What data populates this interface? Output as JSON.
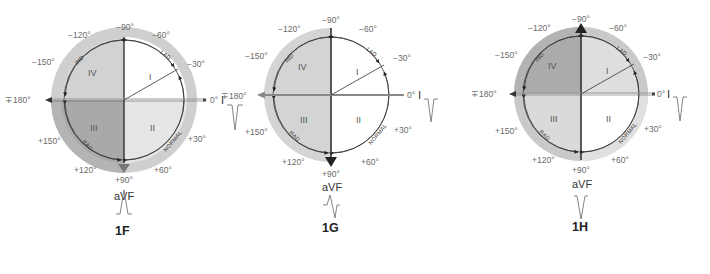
{
  "figures": [
    {
      "id": "1F",
      "label": "1F",
      "center": [
        124,
        100
      ],
      "quadrant_fill": {
        "I": "#ffffff",
        "II": "#e6e6e6",
        "III": "#a9a9a9",
        "IV": "#d2d2d2"
      },
      "outer_ring_fill": "#cfcfcf",
      "outer_ring_extent": "full",
      "axis_arrow": "+90",
      "lead_I_waveform": "negative",
      "aVF_waveform": "positive"
    },
    {
      "id": "1G",
      "label": "1G",
      "center": [
        331,
        95
      ],
      "quadrant_fill": {
        "I": "#ffffff",
        "II": "#ffffff",
        "III": "#d4d4d4",
        "IV": "#d4d4d4"
      },
      "outer_ring_fill": "#d4d4d4",
      "outer_ring_extent": "left-half",
      "axis_arrow": "-180 and +90",
      "lead_I_waveform": "negative",
      "aVF_waveform": "biphasic"
    },
    {
      "id": "1H",
      "label": "1H",
      "center": [
        581,
        94
      ],
      "quadrant_fill": {
        "I": "#dedede",
        "II": "#ffffff",
        "III": "#dadada",
        "IV": "#ababab"
      },
      "outer_ring_fill": "#c9c9c9",
      "outer_ring_extent": "full",
      "axis_arrow": "-90",
      "lead_I_waveform": "negative",
      "aVF_waveform": "negative"
    }
  ],
  "degree_labels": {
    "m90": "−90°",
    "m120": "−120°",
    "m60": "−60°",
    "m150": "−150°",
    "m30": "−30°",
    "pm180": "∓180°",
    "zero": "0°",
    "p150": "+150°",
    "p30": "+30°",
    "p120": "+120°",
    "p60": "+60°",
    "p90": "+90°"
  },
  "quadrants": {
    "I": "I",
    "II": "II",
    "III": "III",
    "IV": "IV"
  },
  "arc_labels": {
    "ind": "IND",
    "lad": "LAD",
    "rad": "RAD",
    "normal": "NORMAL"
  },
  "leads": {
    "lead_I": "I",
    "aVF": "aVF"
  },
  "captions": {
    "f": "1F",
    "g": "1G",
    "h": "1H"
  }
}
